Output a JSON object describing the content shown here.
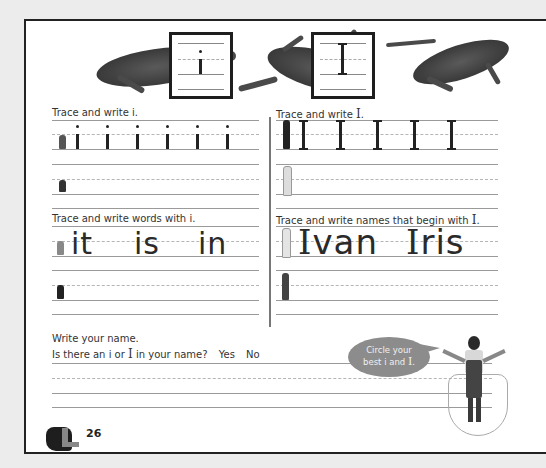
{
  "header": {
    "lowercase_letter": "i",
    "uppercase_letter": "I",
    "illustration": "lizards"
  },
  "sections": [
    {
      "id": "trace-lower",
      "title_prefix": "Trace and write ",
      "title_letter": "i",
      "title_suffix": ".",
      "model_chars": [
        "i",
        "i",
        "i",
        "i",
        "i",
        "i"
      ]
    },
    {
      "id": "trace-upper",
      "title_prefix": "Trace and write ",
      "title_letter": "I",
      "title_suffix": ".",
      "model_chars": [
        "I",
        "I",
        "I",
        "I",
        "I"
      ]
    },
    {
      "id": "words-lower",
      "title_prefix": "Trace and write words with ",
      "title_letter": "i",
      "title_suffix": ".",
      "words": [
        "it",
        "is",
        "in"
      ]
    },
    {
      "id": "names-upper",
      "title_prefix": "Trace and write names that begin with ",
      "title_letter": "I",
      "title_suffix": ".",
      "words": [
        "Ivan",
        "Iris"
      ]
    }
  ],
  "name_section": {
    "instruction": "Write your name.",
    "question_prefix": "Is there an ",
    "question_i": "i",
    "question_or": " or ",
    "question_I": "I",
    "question_suffix": " in your name?",
    "yes": "Yes",
    "no": "No"
  },
  "bubble": {
    "line1": "Circle your",
    "line2_prefix": "best ",
    "line2_i": "i",
    "line2_and": " and ",
    "line2_I": "I",
    "line2_suffix": "."
  },
  "footer": {
    "page_number": "26",
    "icon": "hand-sign-L-icon"
  },
  "colors": {
    "page": "#ffffff",
    "background": "#ececec",
    "border": "#222222",
    "rule": "#9a9a9a",
    "bubble": "#8c8c8c"
  }
}
